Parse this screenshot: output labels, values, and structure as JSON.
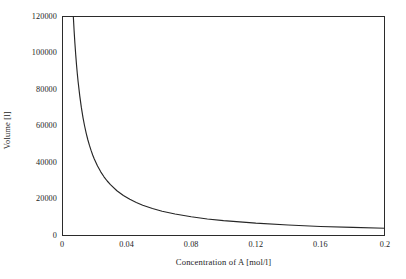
{
  "chart_data": {
    "type": "line",
    "title": "",
    "xlabel": "Concentration of A [mol/l]",
    "ylabel": "Volume [l]",
    "xlim": [
      0,
      0.2
    ],
    "ylim": [
      0,
      120000
    ],
    "grid": false,
    "legend": null,
    "xticks": [
      "0",
      "0.04",
      "0.08",
      "0.12",
      "0.16",
      "0.2"
    ],
    "xtick_values": [
      0,
      0.04,
      0.08,
      0.12,
      0.16,
      0.2
    ],
    "yticks": [
      "0",
      "20000",
      "40000",
      "60000",
      "80000",
      "100000",
      "120000"
    ],
    "ytick_values": [
      0,
      20000,
      40000,
      60000,
      80000,
      100000,
      120000
    ],
    "series": [
      {
        "name": "Volume",
        "x": [
          0.007,
          0.0075,
          0.008,
          0.0085,
          0.009,
          0.0095,
          0.01,
          0.011,
          0.012,
          0.013,
          0.014,
          0.015,
          0.016,
          0.017,
          0.018,
          0.019,
          0.02,
          0.022,
          0.024,
          0.026,
          0.028,
          0.03,
          0.034,
          0.038,
          0.042,
          0.046,
          0.05,
          0.056,
          0.062,
          0.07,
          0.08,
          0.09,
          0.1,
          0.12,
          0.14,
          0.16,
          0.18,
          0.2
        ],
        "y": [
          120000,
          112000,
          105000,
          98800,
          93300,
          88400,
          84000,
          76400,
          70000,
          64600,
          60000,
          56000,
          52500,
          49400,
          46700,
          44200,
          42000,
          38200,
          35000,
          32300,
          30000,
          28000,
          24700,
          22100,
          20000,
          18300,
          16800,
          15000,
          13500,
          12000,
          10500,
          9300,
          8400,
          7000,
          6000,
          5200,
          4700,
          4200
        ]
      }
    ]
  },
  "axis": {
    "y_title": "Volume [l]",
    "x_title": "Concentration of A [mol/l]"
  }
}
